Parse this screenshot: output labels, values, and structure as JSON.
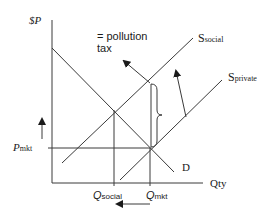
{
  "diagram": {
    "y_axis_label": "$P",
    "x_axis_label": "Qty",
    "annotation": {
      "line1": "= pollution",
      "line2": "tax"
    },
    "curves": {
      "s_social": {
        "main": "S",
        "sub": "social"
      },
      "s_private": {
        "main": "S",
        "sub": "private"
      },
      "demand": "D"
    },
    "price_label": {
      "main": "P",
      "sub": "mkt"
    },
    "q_social_label": {
      "main": "Q",
      "sub": "social"
    },
    "q_mkt_label": {
      "main": "Q",
      "sub": "mkt"
    },
    "colors": {
      "line": "#3a3a3a",
      "text": "#1a1a1a",
      "background": "#ffffff"
    }
  }
}
